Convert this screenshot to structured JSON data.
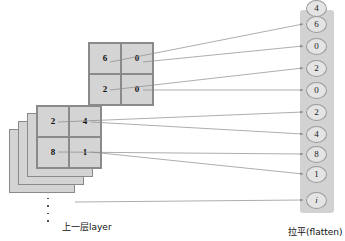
{
  "figure": {
    "colors": {
      "cell_fill": "#d4d4d4",
      "cell_stroke": "#8a8a8a",
      "column_fill": "#d2d2d2",
      "node_fill": "#e4e4e4",
      "node_stroke": "#9a9a9a",
      "connector": "#8a8a8a",
      "text": "#111111"
    }
  },
  "feature_maps": {
    "top_grid": {
      "name": "top-feature-map",
      "rows": 2,
      "cols": 2,
      "cells": [
        "6",
        "0",
        "2",
        "0"
      ]
    },
    "main_grid": {
      "name": "front-feature-map",
      "rows": 2,
      "cols": 2,
      "cells": [
        "2",
        "4",
        "8",
        "1"
      ]
    },
    "hidden_layer_count": 3
  },
  "flatten_column": {
    "nodes": [
      {
        "label": "6",
        "italic": false
      },
      {
        "label": "0",
        "italic": false
      },
      {
        "label": "2",
        "italic": false
      },
      {
        "label": "0",
        "italic": false
      },
      {
        "label": "2",
        "italic": false
      },
      {
        "label": "4",
        "italic": false
      },
      {
        "label": "8",
        "italic": false
      },
      {
        "label": "1",
        "italic": false
      },
      {
        "label": "i",
        "italic": true
      }
    ],
    "ellipsis": "⋮"
  },
  "captions": {
    "layer": "上一层layer",
    "flatten": "拉平(flatten)"
  },
  "connectors": {
    "count": 9,
    "arrowhead": "arrow-marker"
  }
}
